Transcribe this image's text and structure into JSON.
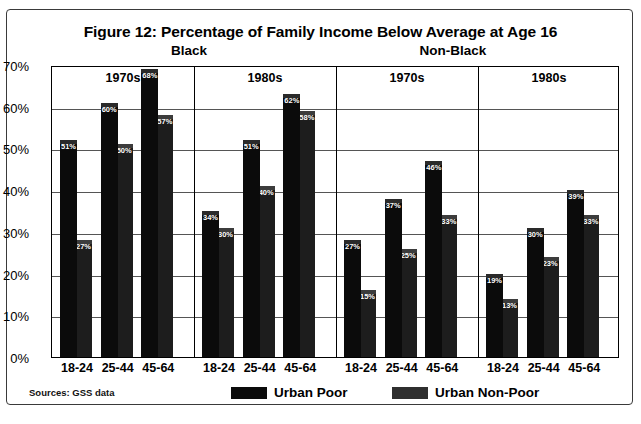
{
  "figure": {
    "title": "Figure 12:  Percentage of Family Income Below Average at Age 16",
    "sources": "Sources: GSS data"
  },
  "group_headers": {
    "black": "Black",
    "non_black": "Non-Black"
  },
  "legend": {
    "poor": "Urban Poor",
    "non_poor": "Urban Non-Poor"
  },
  "axis": {
    "y_ticks": [
      "70%",
      "60%",
      "50%",
      "40%",
      "30%",
      "20%",
      "10%",
      "0%"
    ],
    "x_categories": [
      "18-24",
      "25-44",
      "45-64"
    ]
  },
  "panels": [
    {
      "label": "1970s",
      "group": "Black"
    },
    {
      "label": "1980s",
      "group": "Black"
    },
    {
      "label": "1970s",
      "group": "Non-Black"
    },
    {
      "label": "1980s",
      "group": "Non-Black"
    }
  ],
  "chart_data": {
    "type": "bar",
    "title": "Figure 12:  Percentage of Family Income Below Average at Age 16",
    "xlabel": "",
    "ylabel": "",
    "ylim": [
      0,
      70
    ],
    "ytick_step": 10,
    "grid": true,
    "legend_position": "bottom",
    "categories": [
      "18-24",
      "25-44",
      "45-64"
    ],
    "panel_groups": [
      "Black",
      "Black",
      "Non-Black",
      "Non-Black"
    ],
    "panels": [
      {
        "group": "Black",
        "decade": "1970s",
        "series": [
          {
            "name": "Urban Poor",
            "values": [
              51,
              60,
              68
            ]
          },
          {
            "name": "Urban Non-Poor",
            "values": [
              27,
              50,
              57
            ]
          }
        ]
      },
      {
        "group": "Black",
        "decade": "1980s",
        "series": [
          {
            "name": "Urban Poor",
            "values": [
              34,
              51,
              62
            ]
          },
          {
            "name": "Urban Non-Poor",
            "values": [
              30,
              40,
              58
            ]
          }
        ]
      },
      {
        "group": "Non-Black",
        "decade": "1970s",
        "series": [
          {
            "name": "Urban Poor",
            "values": [
              27,
              37,
              46
            ]
          },
          {
            "name": "Urban Non-Poor",
            "values": [
              15,
              25,
              33
            ]
          }
        ]
      },
      {
        "group": "Non-Black",
        "decade": "1980s",
        "series": [
          {
            "name": "Urban Poor",
            "values": [
              19,
              30,
              39
            ]
          },
          {
            "name": "Urban Non-Poor",
            "values": [
              13,
              23,
              33
            ]
          }
        ]
      }
    ],
    "labels": {
      "black_1970s_poor": [
        "51%",
        "60%",
        "68%"
      ],
      "black_1970s_nonpoor": [
        "27%",
        "50%",
        "57%"
      ],
      "black_1980s_poor": [
        "34%",
        "51%",
        "62%"
      ],
      "black_1980s_nonpoor": [
        "30%",
        "40%",
        "58%"
      ],
      "nonblack_1970s_poor": [
        "27%",
        "37%",
        "46%"
      ],
      "nonblack_1970s_nonpoor": [
        "15%",
        "25%",
        "33%"
      ],
      "nonblack_1980s_poor": [
        "19%",
        "30%",
        "39%"
      ],
      "nonblack_1980s_nonpoor": [
        "13%",
        "23%",
        "33%"
      ]
    }
  }
}
